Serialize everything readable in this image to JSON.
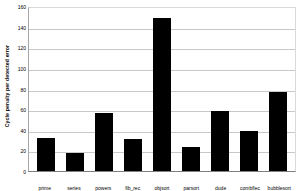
{
  "chart_data": {
    "type": "bar",
    "title": "",
    "xlabel": "",
    "ylabel": "Cycle penalty per detected error",
    "categories": [
      "prime",
      "series",
      "powers",
      "fib_rec",
      "objsort",
      "parsort",
      "dude",
      "combflec",
      "bubblesort"
    ],
    "values": [
      32,
      17,
      56,
      31,
      148,
      23,
      58,
      39,
      77
    ],
    "ylim": [
      0,
      160
    ],
    "yticks": [
      0,
      20,
      40,
      60,
      80,
      100,
      120,
      140,
      160
    ],
    "ytick_labels": [
      "0",
      "20",
      "40",
      "60",
      "80",
      "100",
      "120",
      "140",
      "160"
    ],
    "grid": true,
    "legend": false,
    "series": [
      {
        "name": "Cycle penalty per detected error",
        "values": [
          32,
          17,
          56,
          31,
          148,
          23,
          58,
          39,
          77
        ]
      }
    ],
    "colors": {
      "bar": "#000000",
      "gridline": "#c8c8c8",
      "axis": "#7f7f7f",
      "background": "#ffffff",
      "text": "#000000"
    }
  }
}
